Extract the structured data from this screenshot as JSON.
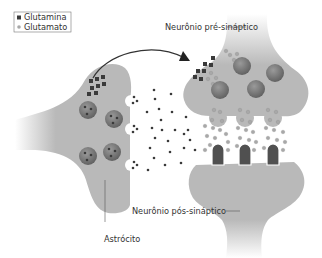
{
  "legend": {
    "items": [
      {
        "label": "Glutamina",
        "marker": "dark-square",
        "color": "#3a3a3a"
      },
      {
        "label": "Glutamato",
        "marker": "light-circle",
        "color": "#a8a8a8"
      }
    ]
  },
  "labels": {
    "presynaptic": "Neurônio pré-sináptico",
    "postsynaptic": "Neurônio pós-sináptico",
    "astrocyte": "Astrócito"
  },
  "colors": {
    "cell_fill": "#b9b9b9",
    "vesicle": "#7c7c7c",
    "glutamine": "#3a3a3a",
    "glutamate": "#a8a8a8",
    "receptor": "#505050"
  }
}
